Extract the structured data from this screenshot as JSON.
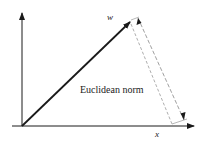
{
  "diagram": {
    "caption": "Euclidean norm",
    "vector_label": "w",
    "x_axis_label": "x",
    "colors": {
      "stroke": "#1a1a1a",
      "dashed": "#888888",
      "background": "#ffffff"
    }
  }
}
